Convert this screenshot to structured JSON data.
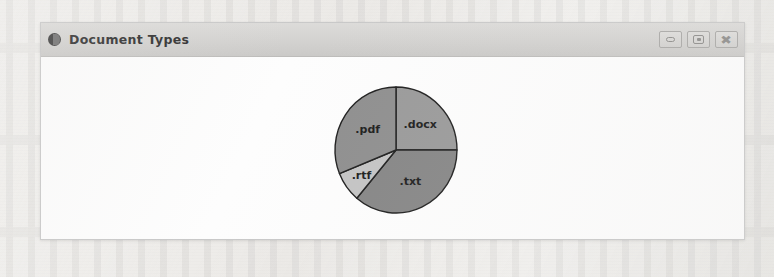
{
  "window": {
    "title": "Document Types",
    "icon": "globe-icon",
    "controls": [
      {
        "name": "minimize",
        "label": "—"
      },
      {
        "name": "maximize",
        "label": "□"
      },
      {
        "name": "close",
        "label": "✖"
      }
    ]
  },
  "chart_data": {
    "type": "pie",
    "title": "Document Types",
    "labels": [
      ".docx",
      ".txt",
      ".rtf",
      ".pdf"
    ],
    "values": [
      25,
      36,
      8,
      31
    ],
    "unit": "percent",
    "start_angle_deg": 0,
    "direction": "clockwise",
    "legend": "none",
    "grid": false,
    "colors": [
      "#9a9a9a",
      "#868686",
      "#c4c4c4",
      "#8f8f8f"
    ],
    "slices": [
      {
        "label": ".docx",
        "value": 25,
        "sweep_deg": 90,
        "color": "#9a9a9a"
      },
      {
        "label": ".txt",
        "value": 36,
        "sweep_deg": 130,
        "color": "#868686"
      },
      {
        "label": ".rtf",
        "value": 8,
        "sweep_deg": 28,
        "color": "#c4c4c4"
      },
      {
        "label": ".pdf",
        "value": 31,
        "sweep_deg": 112,
        "color": "#8f8f8f"
      }
    ]
  },
  "colors": {
    "titlebar": "#d3d2d0",
    "window_bg": "#fdfdfd",
    "page_bg": "#efeeec",
    "outline": "#1f1f1f"
  }
}
